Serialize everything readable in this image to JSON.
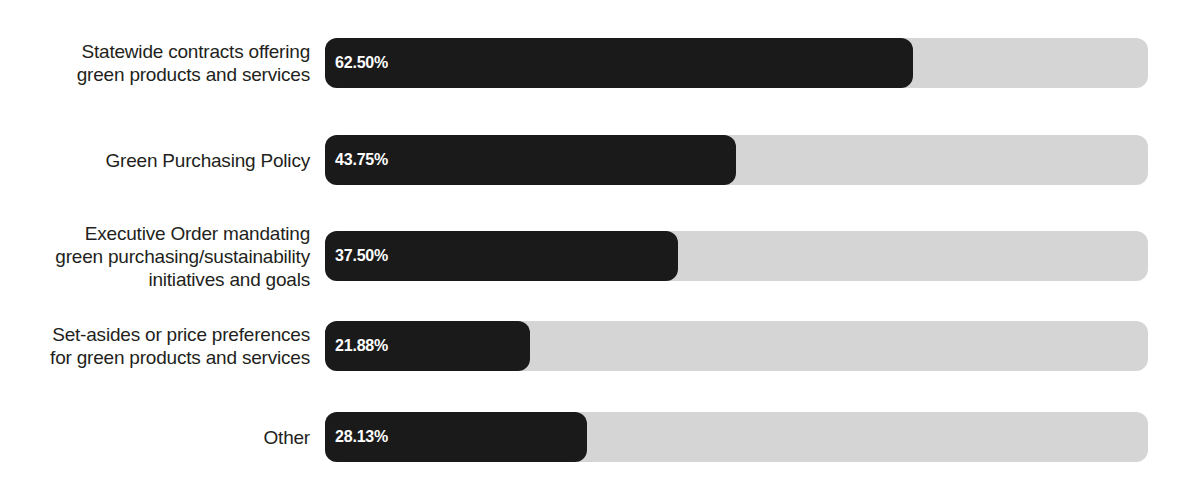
{
  "chart_data": {
    "type": "bar",
    "orientation": "horizontal",
    "title": "",
    "subtitle": "",
    "xlabel": "",
    "ylabel": "",
    "xlim": [
      0,
      100
    ],
    "grid": false,
    "legend": false,
    "value_suffix": "%",
    "categories": [
      "Statewide contracts offering\ngreen products and services",
      "Green Purchasing Policy",
      "Executive Order mandating\ngreen purchasing/sustainability\ninitiatives and goals",
      "Set-asides or price preferences\nfor green products and services",
      "Other"
    ],
    "values": [
      62.5,
      43.75,
      37.5,
      21.88,
      28.13
    ],
    "value_labels": [
      "62.50%",
      "43.75%",
      "37.50%",
      "21.88%",
      "28.13%"
    ],
    "colors": {
      "bar_fill": "#1a1a1a",
      "bar_track": "#d5d5d5",
      "value_text": "#ffffff",
      "label_text": "#231f20",
      "background": "#ffffff"
    },
    "rows": [
      {
        "label": "Statewide contracts offering\ngreen products and services",
        "value": 62.5,
        "value_label": "62.50%",
        "top": 38,
        "height": 50,
        "fill_width_px": 588
      },
      {
        "label": "Green Purchasing Policy",
        "value": 43.75,
        "value_label": "43.75%",
        "top": 135,
        "height": 50,
        "fill_width_px": 411
      },
      {
        "label": "Executive Order mandating\ngreen purchasing/sustainability\ninitiatives and goals",
        "value": 37.5,
        "value_label": "37.50%",
        "top": 231,
        "height": 50,
        "fill_width_px": 353
      },
      {
        "label": "Set-asides or price preferences\nfor green products and services",
        "value": 21.88,
        "value_label": "21.88%",
        "top": 321,
        "height": 50,
        "fill_width_px": 205
      },
      {
        "label": "Other",
        "value": 28.13,
        "value_label": "28.13%",
        "top": 412,
        "height": 50,
        "fill_width_px": 262
      }
    ]
  }
}
